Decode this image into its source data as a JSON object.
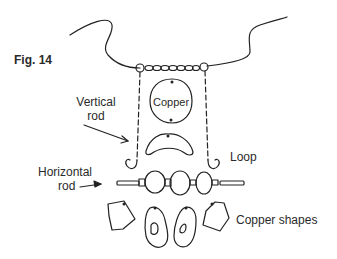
{
  "figure": {
    "label": "Fig. 14",
    "annotations": {
      "copper": "Copper",
      "vertical_rod_line1": "Vertical",
      "vertical_rod_line2": "rod",
      "loop": "Loop",
      "horizontal_rod_line1": "Horizontal",
      "horizontal_rod_line2": "rod",
      "copper_shapes": "Copper shapes"
    }
  }
}
